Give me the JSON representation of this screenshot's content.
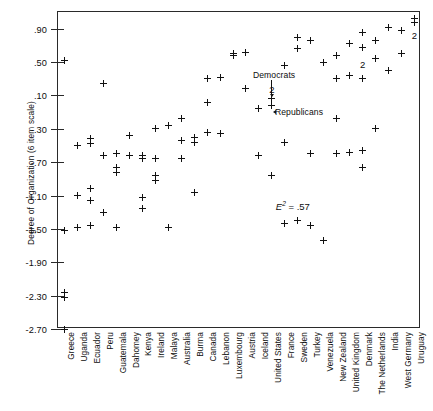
{
  "figure": {
    "y_axis_title": "Degree of Organization (6 item scale)",
    "annotations": {
      "democrats": "Democrats",
      "republicans": "Republicans",
      "e_symbol": "E",
      "e_exponent": "2",
      "e_equals": "= .57",
      "e_full": "E2 = .57"
    },
    "duplicate_marker_label": "2"
  },
  "chart_data": {
    "type": "scatter",
    "title": "",
    "xlabel": "",
    "ylabel": "Degree of Organization (6 item scale)",
    "ylim": [
      -2.7,
      1.1
    ],
    "grid": false,
    "legend": false,
    "y_ticks": [
      0.9,
      0.5,
      0.1,
      -0.3,
      -0.7,
      -1.1,
      -1.5,
      -1.9,
      -2.3,
      -2.7
    ],
    "y_tick_labels": [
      ".90",
      ".50",
      ".10",
      "-.30",
      "-.70",
      "-1.10",
      "-1.50",
      "-1.90",
      "-2.30",
      "-2.70"
    ],
    "categories": [
      "Greece",
      "Uganda",
      "Ecuador",
      "Peru",
      "Guatemala",
      "Dahomey",
      "Kenya",
      "Ireland",
      "Malaya",
      "Australia",
      "Burma",
      "Canada",
      "Lebanon",
      "Luxembourg",
      "Austria",
      "Iceland",
      "United States",
      "France",
      "Sweden",
      "Turkey",
      "Venezuela",
      "New Zealand",
      "United Kingdom",
      "Denmark",
      "The Netherlands",
      "India",
      "West Germany",
      "Uruguay"
    ],
    "points": [
      {
        "x": "Greece",
        "y": -2.7
      },
      {
        "x": "Greece",
        "y": -1.52
      },
      {
        "x": "Greece",
        "y": -2.32
      },
      {
        "x": "Greece",
        "y": -2.26
      },
      {
        "x": "Greece",
        "y": 0.52
      },
      {
        "x": "Uganda",
        "y": -0.5
      },
      {
        "x": "Uganda",
        "y": -1.1
      },
      {
        "x": "Uganda",
        "y": -1.48
      },
      {
        "x": "Ecuador",
        "y": -0.42
      },
      {
        "x": "Ecuador",
        "y": -0.48
      },
      {
        "x": "Ecuador",
        "y": -1.02
      },
      {
        "x": "Ecuador",
        "y": -1.16
      },
      {
        "x": "Ecuador",
        "y": -1.46
      },
      {
        "x": "Peru",
        "y": 0.24
      },
      {
        "x": "Peru",
        "y": -0.62
      },
      {
        "x": "Peru",
        "y": -1.3
      },
      {
        "x": "Guatemala",
        "y": -0.6
      },
      {
        "x": "Guatemala",
        "y": -0.76
      },
      {
        "x": "Guatemala",
        "y": -0.82
      },
      {
        "x": "Guatemala",
        "y": -1.48
      },
      {
        "x": "Dahomey",
        "y": -0.38
      },
      {
        "x": "Dahomey",
        "y": -0.62
      },
      {
        "x": "Kenya",
        "y": -0.62
      },
      {
        "x": "Kenya",
        "y": -0.66
      },
      {
        "x": "Kenya",
        "y": -1.12
      },
      {
        "x": "Kenya",
        "y": -1.26
      },
      {
        "x": "Ireland",
        "y": -0.3
      },
      {
        "x": "Ireland",
        "y": -0.66
      },
      {
        "x": "Ireland",
        "y": -0.86
      },
      {
        "x": "Ireland",
        "y": -0.92
      },
      {
        "x": "Malaya",
        "y": -0.26
      },
      {
        "x": "Malaya",
        "y": -1.48
      },
      {
        "x": "Australia",
        "y": -0.18
      },
      {
        "x": "Australia",
        "y": -0.44
      },
      {
        "x": "Australia",
        "y": -0.66
      },
      {
        "x": "Burma",
        "y": -0.4
      },
      {
        "x": "Burma",
        "y": -0.46
      },
      {
        "x": "Burma",
        "y": -1.06
      },
      {
        "x": "Canada",
        "y": 0.3
      },
      {
        "x": "Canada",
        "y": 0.02
      },
      {
        "x": "Canada",
        "y": -0.34
      },
      {
        "x": "Lebanon",
        "y": 0.32
      },
      {
        "x": "Lebanon",
        "y": -0.36
      },
      {
        "x": "Luxembourg",
        "y": 0.6
      },
      {
        "x": "Luxembourg",
        "y": 0.58
      },
      {
        "x": "Austria",
        "y": 0.62
      },
      {
        "x": "Austria",
        "y": 0.18
      },
      {
        "x": "Iceland",
        "y": -0.06
      },
      {
        "x": "Iceland",
        "y": -0.62
      },
      {
        "x": "United States",
        "y": 0.06
      },
      {
        "x": "United States",
        "y": -0.02
      },
      {
        "x": "United States",
        "y": -0.86
      },
      {
        "x": "France",
        "y": 0.46
      },
      {
        "x": "France",
        "y": -0.46
      },
      {
        "x": "France",
        "y": -1.44
      },
      {
        "x": "Sweden",
        "y": 0.8
      },
      {
        "x": "Sweden",
        "y": 0.66
      },
      {
        "x": "Sweden",
        "y": -1.4
      },
      {
        "x": "Turkey",
        "y": 0.76
      },
      {
        "x": "Turkey",
        "y": -0.6
      },
      {
        "x": "Turkey",
        "y": -1.46
      },
      {
        "x": "Venezuela",
        "y": 0.5
      },
      {
        "x": "Venezuela",
        "y": -1.64
      },
      {
        "x": "New Zealand",
        "y": 0.58
      },
      {
        "x": "New Zealand",
        "y": 0.3
      },
      {
        "x": "New Zealand",
        "y": -0.18
      },
      {
        "x": "New Zealand",
        "y": -0.6
      },
      {
        "x": "United Kingdom",
        "y": 0.72
      },
      {
        "x": "United Kingdom",
        "y": 0.34
      },
      {
        "x": "United Kingdom",
        "y": -0.58
      },
      {
        "x": "Denmark",
        "y": 0.86
      },
      {
        "x": "Denmark",
        "y": 0.68
      },
      {
        "x": "Denmark",
        "y": 0.3
      },
      {
        "x": "Denmark",
        "y": -0.56
      },
      {
        "x": "Denmark",
        "y": -0.76
      },
      {
        "x": "The Netherlands",
        "y": 0.76
      },
      {
        "x": "The Netherlands",
        "y": 0.54
      },
      {
        "x": "The Netherlands",
        "y": -0.3
      },
      {
        "x": "India",
        "y": 0.92
      },
      {
        "x": "India",
        "y": 0.4
      },
      {
        "x": "West Germany",
        "y": 0.88
      },
      {
        "x": "West Germany",
        "y": 0.6
      },
      {
        "x": "Uruguay",
        "y": 1.02
      },
      {
        "x": "Uruguay",
        "y": 0.98
      }
    ],
    "duplicate_markers": [
      {
        "x": "United States",
        "y": 0.18,
        "label": "2"
      },
      {
        "x": "Denmark",
        "y": 0.48,
        "label": "2"
      },
      {
        "x": "Uruguay",
        "y": 0.82,
        "label": "2"
      }
    ],
    "annotations": [
      {
        "text": "Democrats",
        "x": "Iceland",
        "y": 0.34,
        "points_to": {
          "x": "United States",
          "y": 0.06
        }
      },
      {
        "text": "Republicans",
        "x": "France",
        "y": -0.1,
        "points_to": {
          "x": "United States",
          "y": -0.02
        }
      },
      {
        "text": "E2 = .57",
        "x": "Sweden",
        "y": -1.22
      }
    ]
  }
}
